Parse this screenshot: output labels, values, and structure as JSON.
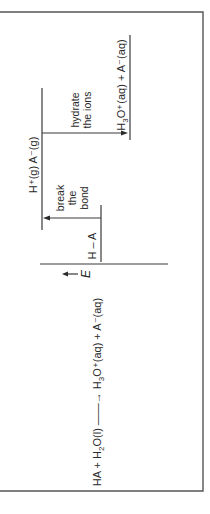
{
  "diagram": {
    "type": "energy-level-diagram",
    "orientation": "rotated-90-ccw",
    "equation": {
      "lhs": "HA + H",
      "lhs_sub": "2",
      "lhs_end": "O(l)",
      "arrow": "→",
      "rhs": "H",
      "rhs_sub": "3",
      "rhs_end": "O⁺(aq) + A⁻(aq)"
    },
    "axis_label": "E",
    "levels": {
      "gas_ions": "H⁺(g) A⁻(g)",
      "reactant": "H – A",
      "product_main": "H",
      "product_sub": "3",
      "product_end": "O⁺(aq) + A⁻(aq)"
    },
    "steps": {
      "break": [
        "break",
        "the",
        "bond"
      ],
      "hydrate": [
        "hydrate",
        "the ions"
      ]
    }
  }
}
